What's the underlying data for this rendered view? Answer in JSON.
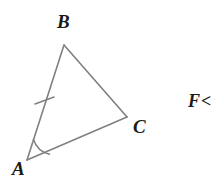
{
  "figure": {
    "background_color": "#ffffff",
    "stroke_color": "#808080",
    "label_color": "#1a1a1a",
    "type": "triangle-geometry-diagram"
  },
  "triangle": {
    "name": "triangle-ABC",
    "vertices": [
      {
        "id": "B",
        "label": "B",
        "x": 64,
        "y": 45
      },
      {
        "id": "C",
        "label": "C",
        "x": 127,
        "y": 117
      },
      {
        "id": "A",
        "label": "A",
        "x": 27,
        "y": 160
      }
    ],
    "sides": [
      {
        "id": "AB",
        "from": "A",
        "to": "B",
        "tick_marks": 1
      },
      {
        "id": "BC",
        "from": "B",
        "to": "C",
        "tick_marks": 0
      },
      {
        "id": "AC",
        "from": "A",
        "to": "C",
        "tick_marks": 0
      }
    ],
    "angle_marks": [
      {
        "at": "A",
        "arcs": 1
      }
    ]
  },
  "labels": {
    "vertex_b": "B",
    "vertex_a": "A",
    "vertex_c": "C"
  },
  "cropped_text": {
    "value": "F<"
  }
}
